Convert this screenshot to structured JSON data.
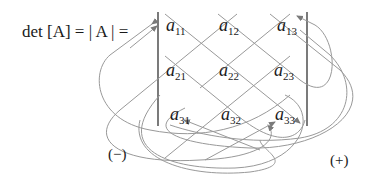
{
  "equation": {
    "lhs": "det [A] = | A | ="
  },
  "matrix": {
    "entries": [
      [
        {
          "var": "a",
          "sub": "11"
        },
        {
          "var": "a",
          "sub": "12"
        },
        {
          "var": "a",
          "sub": "13"
        }
      ],
      [
        {
          "var": "a",
          "sub": "21"
        },
        {
          "var": "a",
          "sub": "22"
        },
        {
          "var": "a",
          "sub": "23"
        }
      ],
      [
        {
          "var": "a",
          "sub": "31"
        },
        {
          "var": "a",
          "sub": "32"
        },
        {
          "var": "a",
          "sub": "33"
        }
      ]
    ]
  },
  "signs": {
    "negative": "(−)",
    "positive": "(+)"
  },
  "colors": {
    "text": "#1a1a1a",
    "bar": "#333333",
    "arrow": "#8a8a8a"
  }
}
